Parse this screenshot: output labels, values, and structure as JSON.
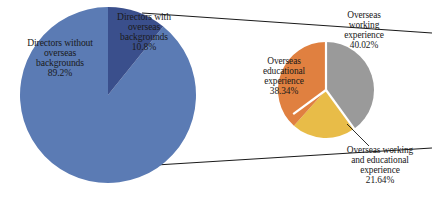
{
  "chart_data": [
    {
      "type": "pie",
      "name": "directors-overseas-background",
      "title": "",
      "categories": [
        "Directors without overseas backgrounds",
        "Directors with overseas backgrounds"
      ],
      "values": [
        89.2,
        10.8
      ],
      "value_labels": [
        "89.2%",
        "10.8%"
      ],
      "colors": [
        "#5B7BB4",
        "#3A4F8C"
      ],
      "start_angle_deg": 0,
      "direction": "clockwise",
      "legend": "none",
      "grid": false,
      "labels": [
        {
          "text": "Directors without\noverseas\nbackgrounds\n89.2%",
          "category": "Directors without overseas backgrounds",
          "value": 89.2
        },
        {
          "text": "Directors with\noverseas\nbackgrounds\n10.8%",
          "category": "Directors with overseas backgrounds",
          "value": 10.8
        }
      ]
    },
    {
      "type": "pie",
      "name": "overseas-experience-breakdown",
      "title": "",
      "categories": [
        "Overseas working experience",
        "Overseas working and educational experience",
        "Overseas educational experience"
      ],
      "values": [
        40.02,
        21.64,
        38.34
      ],
      "value_labels": [
        "40.02%",
        "21.64%",
        "38.34%"
      ],
      "colors": [
        "#9A9A9A",
        "#E8BC48",
        "#E08040"
      ],
      "start_angle_deg": 0,
      "direction": "clockwise",
      "legend": "none",
      "grid": false,
      "labels": [
        {
          "text": "Overseas\nworking\nexperience\n40.02%",
          "category": "Overseas working experience",
          "value": 40.02
        },
        {
          "text": "Overseas working\nand educational\nexperience\n21.64%",
          "category": "Overseas working and educational experience",
          "value": 21.64
        },
        {
          "text": "Overseas\neducational\nexperience\n38.34%",
          "category": "Overseas educational experience",
          "value": 38.34
        }
      ]
    }
  ],
  "figure": {
    "background_color": "#FFFFFF",
    "connector_color": "#1a1a1a",
    "slice_separator_color": "#FFFFFF"
  },
  "main_pie": {
    "label_without": "Directors without\noverseas\nbackgrounds\n89.2%",
    "label_with": "Directors with\noverseas\nbackgrounds\n10.8%"
  },
  "secondary_pie": {
    "label_working": "Overseas\nworking\nexperience\n40.02%",
    "label_educational": "Overseas\neducational\nexperience\n38.34%",
    "label_both": "Overseas working\nand educational\nexperience\n21.64%"
  }
}
